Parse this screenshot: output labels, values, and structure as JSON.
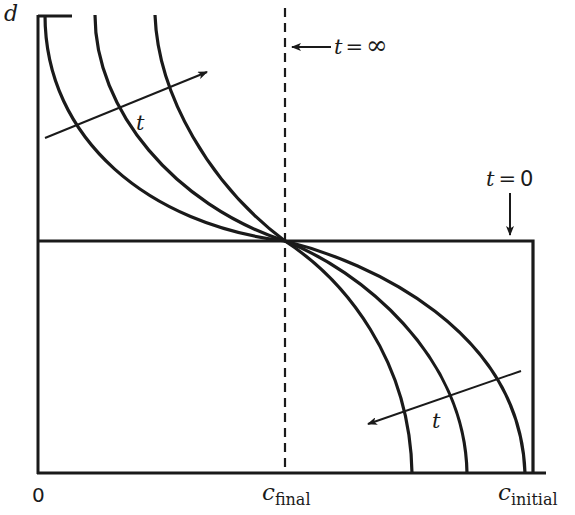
{
  "diagram": {
    "type": "concentration-depth profile evolution",
    "colors": {
      "line": "#1a1a1a",
      "background": "#ffffff"
    },
    "axes": {
      "y_label": "d",
      "x_origin_label": "0",
      "x_tick_labels": [
        {
          "base": "c",
          "sub": "final"
        },
        {
          "base": "c",
          "sub": "initial"
        }
      ]
    },
    "annotations": {
      "t_infinity": {
        "t": "t",
        "eq": "=",
        "val": "∞"
      },
      "t_zero": {
        "t": "t",
        "eq": "=",
        "val": "0"
      },
      "time_arrow_upper": "t",
      "time_arrow_lower": "t"
    },
    "curves": {
      "count": 3,
      "initial_profile": "step function at d mid-depth",
      "final_profile": "vertical dashed line at c_final"
    }
  }
}
